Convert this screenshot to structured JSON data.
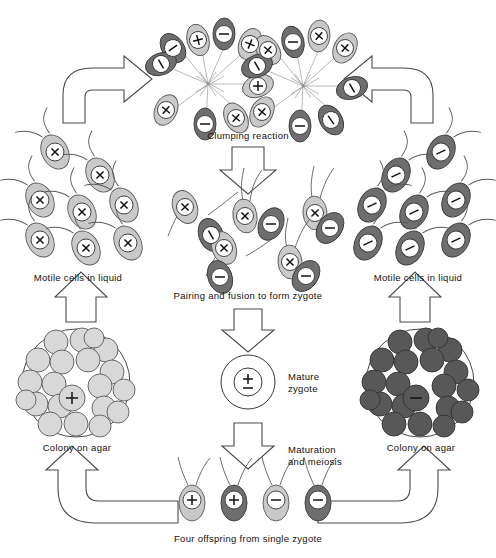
{
  "figure": {
    "plus_sign": "+",
    "minus_sign": "−",
    "plusminus_sign": "±"
  },
  "labels": {
    "clumping": "Clumping reaction",
    "pairing": "Pairing and fusion to form zygote",
    "mature_zygote_line1": "Mature",
    "mature_zygote_line2": "zygote",
    "maturation_line1": "Maturation",
    "maturation_line2": "and meiosis",
    "offspring": "Four offspring from single zygote",
    "motile_left": "Motile cells in liquid",
    "motile_right": "Motile cells in liquid",
    "colony_left": "Colony on agar",
    "colony_right": "Colony on agar"
  },
  "colors": {
    "plus_cell": "#c9c9c9",
    "minus_cell": "#6e6e6e",
    "outline": "#4a4a4a",
    "background": "#ffffff",
    "sign_face": "#ffffff"
  },
  "clumping": {
    "left_cluster_signs": [
      "+",
      "+",
      "−",
      "+",
      "+",
      "−",
      "−",
      "+"
    ],
    "right_cluster_signs": [
      "+",
      "−",
      "+",
      "+",
      "−",
      "−",
      "+",
      "−"
    ],
    "cluster_count": 2,
    "cells_per_cluster": 8
  },
  "motile_left": {
    "sign": "+",
    "shade": "light",
    "count": 7
  },
  "motile_right": {
    "sign": "−",
    "shade": "dark",
    "count": 7
  },
  "colony_left": {
    "sign": "+",
    "shade": "light",
    "cell_count": 22
  },
  "colony_right": {
    "sign": "−",
    "shade": "dark",
    "cell_count": 22
  },
  "pairing": {
    "pair_count": 4,
    "pairs": [
      {
        "plus_shade": "light",
        "minus_shade": "dark",
        "state": "attached"
      },
      {
        "plus_shade": "light",
        "minus_shade": "dark",
        "state": "attached"
      },
      {
        "plus_shade": "light",
        "minus_shade": "dark",
        "state": "fusing"
      },
      {
        "plus_shade": "light",
        "minus_shade": "dark",
        "state": "fusing"
      }
    ]
  },
  "zygote": {
    "sign": "±",
    "shape": "double-circle"
  },
  "offspring": [
    {
      "sign": "+",
      "shade": "light"
    },
    {
      "sign": "+",
      "shade": "dark"
    },
    {
      "sign": "−",
      "shade": "light"
    },
    {
      "sign": "−",
      "shade": "dark"
    }
  ],
  "arrows": [
    {
      "name": "left-curved-up-right",
      "direction": "right"
    },
    {
      "name": "right-curved-up-left",
      "direction": "left"
    },
    {
      "name": "clumping-to-pairing",
      "direction": "down"
    },
    {
      "name": "pairing-to-zygote",
      "direction": "down"
    },
    {
      "name": "zygote-to-offspring",
      "direction": "down"
    },
    {
      "name": "left-colony-to-motile",
      "direction": "up"
    },
    {
      "name": "right-colony-to-motile",
      "direction": "up"
    },
    {
      "name": "offspring-to-left-colony",
      "direction": "up-left"
    },
    {
      "name": "offspring-to-right-colony",
      "direction": "up-right"
    }
  ]
}
